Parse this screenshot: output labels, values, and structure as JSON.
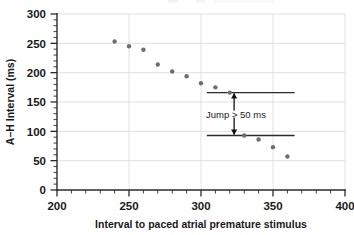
{
  "chart_data": {
    "type": "scatter",
    "title": "",
    "xlabel": "Interval to paced atrial premature stimulus",
    "ylabel": "A–H Interval (ms)",
    "xlim": [
      200,
      400
    ],
    "ylim": [
      0,
      300
    ],
    "x_major_ticks": [
      200,
      250,
      300,
      350,
      400
    ],
    "y_major_ticks": [
      0,
      50,
      100,
      150,
      200,
      250,
      300
    ],
    "x_tick_labels": [
      "200",
      "250",
      "300",
      "350",
      "400"
    ],
    "y_tick_labels": [
      "0",
      "50",
      "100",
      "150",
      "200",
      "250",
      "300"
    ],
    "x_minor_interval": 10,
    "y_minor_interval": 10,
    "grid": "major-gridlines-both-axes",
    "legend": "none",
    "marker": {
      "shape": "circle",
      "color": "#6e6e6e",
      "size_px": 4
    },
    "x": [
      240,
      250,
      260,
      270,
      280,
      290,
      300,
      310,
      320,
      330,
      340,
      350,
      360
    ],
    "y": [
      253,
      245,
      239,
      214,
      202,
      194,
      182,
      175,
      166,
      93,
      86,
      73,
      57
    ],
    "points": [
      {
        "x": 240,
        "y": 253
      },
      {
        "x": 250,
        "y": 245
      },
      {
        "x": 260,
        "y": 239
      },
      {
        "x": 270,
        "y": 214
      },
      {
        "x": 280,
        "y": 202
      },
      {
        "x": 290,
        "y": 194
      },
      {
        "x": 300,
        "y": 182
      },
      {
        "x": 310,
        "y": 175
      },
      {
        "x": 320,
        "y": 166
      },
      {
        "x": 330,
        "y": 93
      },
      {
        "x": 340,
        "y": 86
      },
      {
        "x": 350,
        "y": 73
      },
      {
        "x": 360,
        "y": 57
      }
    ],
    "reference_lines": [
      {
        "y": 166,
        "x_start": 304,
        "x_end": 365
      },
      {
        "y": 93,
        "x_start": 304,
        "x_end": 365
      }
    ],
    "annotations": [
      {
        "text": "Jump > 50 ms",
        "x": 323,
        "y_top": 166,
        "y_bottom": 93,
        "style": "double-headed-vertical-arrow-with-label"
      }
    ]
  },
  "axes": {
    "x_title": "Interval to paced atrial premature stimulus",
    "y_title": "A–H Interval (ms)"
  },
  "annotation": {
    "jump_label": "Jump > 50 ms"
  },
  "ticks": {
    "x": [
      "200",
      "250",
      "300",
      "350",
      "400"
    ],
    "y": [
      "0",
      "50",
      "100",
      "150",
      "200",
      "250",
      "300"
    ]
  }
}
